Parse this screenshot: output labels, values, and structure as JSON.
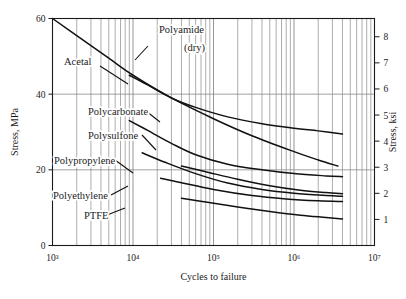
{
  "figure": {
    "background": "#ffffff",
    "axis_color": "#1a1a1a",
    "grid_color": "#8a8a8a",
    "curve_color": "#111111"
  },
  "axes": {
    "x": {
      "label": "Cycles to failure",
      "scale": "log",
      "min": 1000,
      "max": 10000000,
      "tick_labels": [
        "10³",
        "10⁴",
        "10⁵",
        "10⁶",
        "10⁷"
      ],
      "tick_values": [
        1000,
        10000,
        100000,
        1000000,
        10000000
      ],
      "minor_grid": true
    },
    "y_left": {
      "label": "Stress, MPa",
      "scale": "linear",
      "min": 0,
      "max": 60,
      "tick_labels": [
        "0",
        "20",
        "40",
        "60"
      ],
      "tick_values": [
        0,
        20,
        40,
        60
      ]
    },
    "y_right": {
      "label": "Stress, ksi",
      "scale": "linear",
      "min": 0,
      "max": 8.7,
      "tick_labels": [
        "1",
        "2",
        "3",
        "4",
        "5",
        "6",
        "7",
        "8"
      ],
      "tick_values": [
        1,
        2,
        3,
        4,
        5,
        6,
        7,
        8
      ]
    }
  },
  "chart_data": {
    "type": "line",
    "title": "",
    "xlabel": "Cycles to failure",
    "ylabel": "Stress, MPa",
    "ylabel_secondary": "Stress, ksi",
    "xscale": "log",
    "xlim": [
      1000,
      10000000
    ],
    "ylim": [
      0,
      60
    ],
    "ylim_secondary": [
      0,
      8.7
    ],
    "grid": true,
    "legend": "inline-labels",
    "series": [
      {
        "name": "Polyamide (dry)",
        "label_text": "Polyamide\n(dry)",
        "points": [
          {
            "x": 1000,
            "y": 60.0
          },
          {
            "x": 2000,
            "y": 55.5
          },
          {
            "x": 5000,
            "y": 49.5
          },
          {
            "x": 10000,
            "y": 45.0
          },
          {
            "x": 30000,
            "y": 39.0
          },
          {
            "x": 100000,
            "y": 33.5
          },
          {
            "x": 300000,
            "y": 29.0
          },
          {
            "x": 1000000,
            "y": 24.8
          },
          {
            "x": 2000000,
            "y": 22.6
          },
          {
            "x": 3500000,
            "y": 21.0
          }
        ]
      },
      {
        "name": "Acetal",
        "label_text": "Acetal",
        "points": [
          {
            "x": 9000,
            "y": 45.0
          },
          {
            "x": 15000,
            "y": 42.5
          },
          {
            "x": 30000,
            "y": 39.0
          },
          {
            "x": 60000,
            "y": 36.5
          },
          {
            "x": 150000,
            "y": 34.0
          },
          {
            "x": 400000,
            "y": 32.2
          },
          {
            "x": 1000000,
            "y": 31.0
          },
          {
            "x": 2000000,
            "y": 30.3
          },
          {
            "x": 4000000,
            "y": 29.5
          }
        ]
      },
      {
        "name": "Polycarbonate",
        "label_text": "Polycarbonate",
        "points": [
          {
            "x": 9000,
            "y": 33.0
          },
          {
            "x": 15000,
            "y": 30.5
          },
          {
            "x": 30000,
            "y": 27.0
          },
          {
            "x": 60000,
            "y": 24.0
          },
          {
            "x": 150000,
            "y": 21.5
          },
          {
            "x": 400000,
            "y": 20.0
          },
          {
            "x": 1000000,
            "y": 19.0
          },
          {
            "x": 2500000,
            "y": 18.4
          },
          {
            "x": 4000000,
            "y": 18.2
          }
        ]
      },
      {
        "name": "Polysulfone",
        "label_text": "Polysulfone",
        "points": [
          {
            "x": 13000,
            "y": 24.5
          },
          {
            "x": 25000,
            "y": 22.0
          },
          {
            "x": 60000,
            "y": 19.0
          },
          {
            "x": 150000,
            "y": 16.5
          },
          {
            "x": 400000,
            "y": 14.8
          },
          {
            "x": 1000000,
            "y": 13.8
          },
          {
            "x": 2500000,
            "y": 13.2
          },
          {
            "x": 4000000,
            "y": 13.0
          }
        ]
      },
      {
        "name": "Polypropylene",
        "label_text": "Polypropylene",
        "points": [
          {
            "x": 40000,
            "y": 21.0
          },
          {
            "x": 80000,
            "y": 19.5
          },
          {
            "x": 200000,
            "y": 17.5
          },
          {
            "x": 500000,
            "y": 15.8
          },
          {
            "x": 1200000,
            "y": 14.6
          },
          {
            "x": 2500000,
            "y": 14.0
          },
          {
            "x": 4000000,
            "y": 13.7
          }
        ]
      },
      {
        "name": "Polyethylene",
        "label_text": "Polyethylene",
        "points": [
          {
            "x": 22000,
            "y": 17.8
          },
          {
            "x": 40000,
            "y": 16.6
          },
          {
            "x": 100000,
            "y": 14.8
          },
          {
            "x": 300000,
            "y": 13.2
          },
          {
            "x": 800000,
            "y": 12.3
          },
          {
            "x": 2000000,
            "y": 11.8
          },
          {
            "x": 4000000,
            "y": 11.6
          }
        ]
      },
      {
        "name": "PTFE",
        "label_text": "PTFE",
        "points": [
          {
            "x": 40000,
            "y": 12.5
          },
          {
            "x": 80000,
            "y": 11.5
          },
          {
            "x": 200000,
            "y": 10.2
          },
          {
            "x": 500000,
            "y": 9.0
          },
          {
            "x": 1200000,
            "y": 8.0
          },
          {
            "x": 2500000,
            "y": 7.4
          },
          {
            "x": 4000000,
            "y": 7.0
          }
        ]
      }
    ],
    "annotations": [
      {
        "text": "Polyamide",
        "x_px": 159,
        "y_px": 33
      },
      {
        "text": "(dry)",
        "x_px": 184,
        "y_px": 51
      },
      {
        "text": "Acetal",
        "x_px": 64,
        "y_px": 65
      },
      {
        "text": "Polycarbonate",
        "x_px": 88,
        "y_px": 115
      },
      {
        "text": "Polysulfone",
        "x_px": 88,
        "y_px": 139
      },
      {
        "text": "Polypropylene",
        "x_px": 54,
        "y_px": 164
      },
      {
        "text": "Polyethylene",
        "x_px": 53,
        "y_px": 199
      },
      {
        "text": "PTFE",
        "x_px": 84,
        "y_px": 219
      }
    ]
  }
}
